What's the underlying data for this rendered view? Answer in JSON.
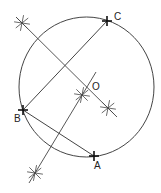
{
  "diagram": {
    "title": "",
    "colors": {
      "line": "#444444",
      "point": "#111111",
      "background": "#ffffff"
    },
    "circle": {
      "cx": 86.5,
      "cy": 87,
      "rx": 67.5,
      "ry": 70
    },
    "points": [
      {
        "id": "C",
        "label": "C",
        "x": 107,
        "y": 21,
        "label_x": 114,
        "label_y": 12
      },
      {
        "id": "B",
        "label": "B",
        "x": 23,
        "y": 110,
        "label_x": 14,
        "label_y": 114
      },
      {
        "id": "A",
        "label": "A",
        "x": 94,
        "y": 156,
        "label_x": 94,
        "label_y": 161
      },
      {
        "id": "O",
        "label": "O",
        "x": 82,
        "y": 95,
        "label_x": 92,
        "label_y": 82
      }
    ],
    "chords": [
      {
        "from": "B",
        "to": "C"
      },
      {
        "from": "B",
        "to": "A"
      }
    ],
    "bisectors": [
      {
        "name": "bisector-bc",
        "x1": 16,
        "y1": 17,
        "x2": 117,
        "y2": 117
      },
      {
        "name": "bisector-ba",
        "x1": 29,
        "y1": 183,
        "x2": 96,
        "y2": 72
      }
    ],
    "arc_crosses": [
      {
        "name": "arc-cross-upper-left",
        "x": 22,
        "y": 23
      },
      {
        "name": "arc-cross-right",
        "x": 108,
        "y": 108
      },
      {
        "name": "arc-cross-lower-left",
        "x": 35,
        "y": 173
      },
      {
        "name": "arc-cross-center",
        "x": 82,
        "y": 95
      }
    ]
  }
}
